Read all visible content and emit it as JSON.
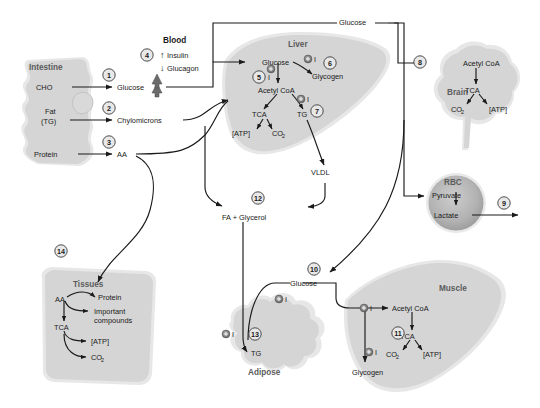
{
  "figure": {
    "background_color": "#ffffff",
    "organ_fill": "#d5d5d5",
    "organ_halo": "#e3e3e3",
    "rbc_fill": "#b5b5b5",
    "line_color": "#1a1a1a",
    "organ_label_color": "#5b5b5b"
  },
  "organs": {
    "intestine": {
      "name": "Intestine",
      "substrates": [
        "CHO",
        "Fat",
        "(TG)",
        "Protein"
      ],
      "products": [
        "Glucose",
        "Chylomicrons",
        "AA"
      ]
    },
    "blood": {
      "name": "Blood",
      "hormones": [
        {
          "arrow": "up",
          "label": "Insulin"
        },
        {
          "arrow": "down",
          "label": "Glucagon"
        }
      ],
      "glucose_trend": "up"
    },
    "liver": {
      "name": "Liver",
      "nodes": [
        "Glucose",
        "Glycogen",
        "Acetyl CoA",
        "TCA",
        "TG",
        "[ATP]",
        "CO",
        "VLDL"
      ],
      "co2_sub": "2",
      "insulin_markers": 3
    },
    "brain": {
      "name": "Brain",
      "nodes": [
        "Acetyl CoA",
        "TCA",
        "CO",
        "[ATP]"
      ],
      "co2_sub": "2"
    },
    "rbc": {
      "name": "RBC",
      "nodes": [
        "Pyruvate",
        "Lactate"
      ]
    },
    "muscle": {
      "name": "Muscle",
      "nodes": [
        "Acetyl CoA",
        "TCA",
        "CO",
        "[ATP]",
        "Glycogen"
      ],
      "co2_sub": "2",
      "insulin_markers": 2
    },
    "adipose": {
      "name": "Adipose",
      "nodes": [
        "TG"
      ],
      "insulin_markers": 2
    },
    "tissues": {
      "name": "Tissues",
      "nodes": [
        "AA",
        "Protein",
        "Important",
        "compounds",
        "TCA",
        "[ATP]",
        "CO"
      ],
      "co2_sub": "2"
    }
  },
  "hub_labels": {
    "blood_glucose_top": "Glucose",
    "fa_glycerol": "FA + Glycerol",
    "peripheral_glucose": "Glucose"
  },
  "steps": [
    {
      "id": "1",
      "label": "1"
    },
    {
      "id": "2",
      "label": "2"
    },
    {
      "id": "3",
      "label": "3"
    },
    {
      "id": "4",
      "label": "4"
    },
    {
      "id": "5",
      "label": "5"
    },
    {
      "id": "6",
      "label": "6"
    },
    {
      "id": "7",
      "label": "7"
    },
    {
      "id": "8",
      "label": "8"
    },
    {
      "id": "9",
      "label": "9"
    },
    {
      "id": "10",
      "label": "10"
    },
    {
      "id": "11",
      "label": "11"
    },
    {
      "id": "12",
      "label": "12"
    },
    {
      "id": "13",
      "label": "13"
    },
    {
      "id": "14",
      "label": "14"
    }
  ],
  "insulin_symbol": {
    "glyph": "+",
    "letter": "I"
  }
}
